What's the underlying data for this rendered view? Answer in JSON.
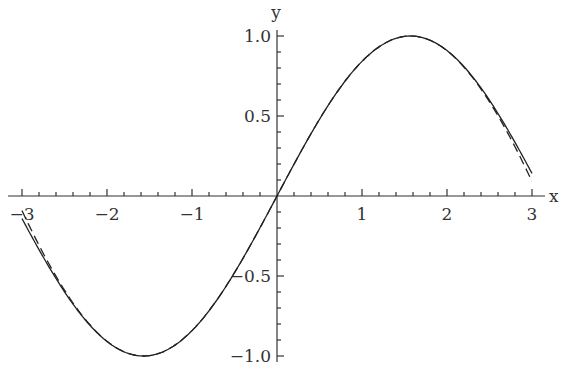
{
  "chart_data": {
    "type": "line",
    "title": "",
    "xlabel": "x",
    "ylabel": "y",
    "xlim": [
      -3,
      3
    ],
    "ylim": [
      -1.0,
      1.0
    ],
    "grid": false,
    "x_ticks": [
      "-3",
      "-2",
      "-1",
      "1",
      "2",
      "3"
    ],
    "y_ticks": [
      "1.0",
      "0.5",
      "-0.5",
      "-1.0"
    ],
    "series": [
      {
        "name": "sin(x)",
        "style": "solid",
        "function": "sin(x)"
      },
      {
        "name": "approximation",
        "style": "dashed",
        "function": "x - x^3/6 + x^5/120 - x^7/5040"
      }
    ]
  }
}
